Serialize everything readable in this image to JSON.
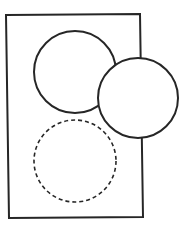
{
  "canvas": {
    "width": 184,
    "height": 228,
    "background": "#ffffff"
  },
  "stroke_color": "#262626",
  "shapes": {
    "frame": {
      "type": "rectangle",
      "points": "6,15 140,14 143,217 9,218",
      "stroke_width": 2
    },
    "circle_top": {
      "type": "circle",
      "cx": 75,
      "cy": 72,
      "r": 41,
      "style": "solid",
      "stroke_width": 2
    },
    "circle_right": {
      "type": "circle",
      "cx": 138,
      "cy": 98,
      "r": 40,
      "style": "solid",
      "stroke_width": 2
    },
    "circle_bottom": {
      "type": "circle",
      "cx": 75,
      "cy": 161,
      "r": 41,
      "style": "dashed",
      "dash": "4 3",
      "stroke_width": 1.6
    }
  }
}
